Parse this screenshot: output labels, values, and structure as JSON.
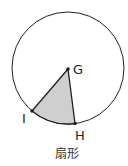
{
  "diagram": {
    "caption": "扇形",
    "points": {
      "G": {
        "label": "G",
        "x": 68,
        "y": 69
      },
      "I": {
        "label": "I",
        "x": 32,
        "y": 111
      },
      "H": {
        "label": "H",
        "x": 75,
        "y": 123
      }
    },
    "circle": {
      "cx": 68,
      "cy": 68,
      "r": 56
    },
    "colors": {
      "fill": "#cfcfcf",
      "stroke": "#222222"
    }
  }
}
